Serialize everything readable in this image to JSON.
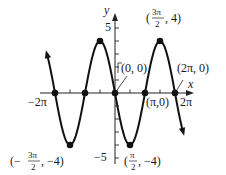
{
  "chart_data": {
    "type": "line",
    "title": "",
    "function": "y = -4 sin(x)",
    "xlabel": "x",
    "ylabel": "y",
    "xlim": [
      -6.6,
      6.6
    ],
    "ylim": [
      -5.3,
      5.5
    ],
    "x_tick_labels": [
      {
        "x": -6.2832,
        "label": "−2π"
      },
      {
        "x": 6.2832,
        "label": "2π"
      }
    ],
    "y_tick_labels": [
      {
        "y": 5,
        "label": "5"
      },
      {
        "y": -5,
        "label": "−5"
      }
    ],
    "x_ticks_per_pi": 2,
    "y_ticks": [
      -5,
      -4,
      -3,
      -2,
      -1,
      1,
      2,
      3,
      4,
      5
    ],
    "grid": false,
    "key_points": [
      {
        "x": -6.2832,
        "y": 0,
        "label": ""
      },
      {
        "x": -4.7124,
        "y": -4,
        "label": "(−3π/2, −4)"
      },
      {
        "x": -3.1416,
        "y": 0,
        "label": ""
      },
      {
        "x": -1.5708,
        "y": 4,
        "label": ""
      },
      {
        "x": 0,
        "y": 0,
        "label": "(0, 0)"
      },
      {
        "x": 1.5708,
        "y": -4,
        "label": "(π/2, −4)"
      },
      {
        "x": 3.1416,
        "y": 0,
        "label": "(π,0)"
      },
      {
        "x": 4.7124,
        "y": 4,
        "label": "(3π/2, 4)"
      },
      {
        "x": 6.2832,
        "y": 0,
        "label": "(2π, 0)"
      }
    ],
    "series": [
      {
        "name": "y = -4 sin x",
        "x_range": [
          -7.1,
          7.1
        ],
        "amplitude": -4,
        "arrows": "both"
      }
    ]
  },
  "labels": {
    "y_axis": "y",
    "x_axis": "x",
    "y5": "5",
    "yneg5": "−5",
    "xneg2pi": "−2π",
    "x2pi": "2π",
    "origin": "(0, 0)",
    "pi0": "(π,0)",
    "twopi0": "(2π, 0)",
    "peak_num": "3π",
    "peak_den": "2",
    "peak_rest": ", 4)",
    "trough_l_pre": "(−",
    "trough_l_num": "3π",
    "trough_l_den": "2",
    "trough_l_rest": ", −4)",
    "trough_r_num": "π",
    "trough_r_den": "2",
    "trough_r_rest": ", −4)"
  }
}
